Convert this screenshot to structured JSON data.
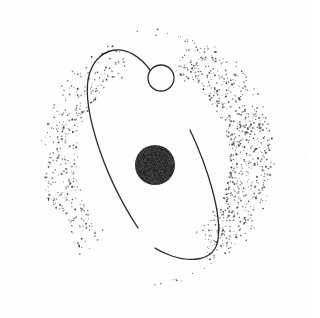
{
  "figure": {
    "background_color": "#fefefe",
    "ink_color": "#2b2b2b",
    "stipple_color": "#3a3a3a",
    "width": 310,
    "height": 318
  },
  "elements": {
    "central_disc": {
      "name": "central-black-disc",
      "center_x": 155,
      "center_y": 165,
      "radius": 20,
      "fill": "#1c1c1c",
      "texture": "grainy"
    },
    "small_circle": {
      "name": "small-open-circle",
      "center_x": 161,
      "center_y": 78,
      "radius": 13,
      "fill": "none",
      "stroke": "#2b2b2b",
      "stroke_width": 1.3
    },
    "orbit_arc_left": {
      "name": "orbit-arc-left",
      "path": "M 150 70 C 130 42 100 44 90 72 C 80 100 100 170 138 228",
      "stroke_width": 1.3
    },
    "orbit_arc_right": {
      "name": "orbit-arc-right",
      "path": "M 190 130 C 208 168 222 214 218 240 C 214 262 190 262 172 256 C 164 253 158 250 155 248",
      "stroke_width": 1.3
    }
  },
  "stipple_bands": [
    {
      "name": "stipple-band-left",
      "cx": 152,
      "cy": 160,
      "outer_rx": 112,
      "outer_ry": 126,
      "start_angle": 128,
      "end_angle": 252,
      "thickness": 36,
      "density": 0.55,
      "seed": 17
    },
    {
      "name": "stipple-band-right",
      "cx": 150,
      "cy": 158,
      "outer_rx": 124,
      "outer_ry": 132,
      "start_angle": -72,
      "end_angle": 58,
      "thickness": 44,
      "density": 0.8,
      "seed": 41
    }
  ],
  "stipple_tails": [
    {
      "name": "stipple-tail-top",
      "cx": 150,
      "cy": 158,
      "rx": 118,
      "ry": 126,
      "start_angle": -96,
      "end_angle": -62,
      "thickness": 6,
      "density": 0.22,
      "seed": 73
    },
    {
      "name": "stipple-tail-bottom",
      "cx": 152,
      "cy": 160,
      "rx": 112,
      "ry": 124,
      "start_angle": 58,
      "end_angle": 92,
      "thickness": 6,
      "density": 0.22,
      "seed": 91
    }
  ],
  "chart_data": {
    "type": "scatter",
    "xlabel": "",
    "ylabel": "",
    "grid": false,
    "legend": "none",
    "xlim": [
      0,
      310
    ],
    "ylim": [
      0,
      318
    ],
    "annotations": [
      "central black disc",
      "small open circle on orbit",
      "two open elliptical orbit arcs",
      "left stippled crescent band",
      "right stippled crescent band",
      "sparse dotted tails at top-right and bottom-left"
    ]
  }
}
